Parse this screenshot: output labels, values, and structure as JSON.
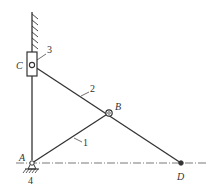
{
  "diagram": {
    "type": "slider-crank mechanism",
    "points": {
      "A": {
        "label": "A",
        "x": 32,
        "y": 163
      },
      "B": {
        "label": "B",
        "x": 109,
        "y": 113
      },
      "C": {
        "label": "C",
        "x": 32,
        "y": 65
      },
      "D": {
        "label": "D",
        "x": 181,
        "y": 163
      }
    },
    "links": [
      {
        "id": "1",
        "label": "1",
        "from": "A",
        "to": "B"
      },
      {
        "id": "2",
        "label": "2",
        "from": "C",
        "to": "D"
      },
      {
        "id": "3",
        "label": "3",
        "part": "slider"
      },
      {
        "id": "4",
        "label": "4",
        "part": "frame"
      }
    ],
    "colors": {
      "stroke": "#333333",
      "background": "#ffffff"
    }
  }
}
